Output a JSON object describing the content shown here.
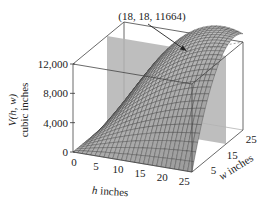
{
  "chart_data": {
    "type": "surface3d",
    "title": "",
    "function": "V(h, w) = h·w·(72 − h − w)",
    "zlabel_line1": "V(h, w)",
    "zlabel_line2": "cubic inches",
    "xlabel": "h inches",
    "ylabel": "w inches",
    "x_ticks": [
      "0",
      "5",
      "10",
      "15",
      "20",
      "25"
    ],
    "x_tick_values": [
      0,
      5,
      10,
      15,
      20,
      25
    ],
    "y_ticks": [
      "5",
      "15",
      "25"
    ],
    "y_tick_values": [
      5,
      15,
      25
    ],
    "z_ticks": [
      "0",
      "4,000",
      "8,000",
      "12,000"
    ],
    "z_tick_values": [
      0,
      4000,
      8000,
      12000
    ],
    "xlim": [
      0,
      27
    ],
    "ylim": [
      0,
      27
    ],
    "zlim": [
      0,
      12000
    ],
    "annotation": {
      "text": "(18, 18, 11664)",
      "point": {
        "h": 18,
        "w": 18,
        "V": 11664
      }
    },
    "max_point": {
      "h": 18,
      "w": 18,
      "V": 11664
    },
    "plane": {
      "description": "vertical gray plane at w = 18",
      "color": "#b5b5b5"
    },
    "grid": "wireframe mesh on surface"
  },
  "colors": {
    "surface_fill": "#c8c8c8",
    "mesh": "#333333",
    "plane": "#b3b3b3",
    "box": "#444444"
  }
}
